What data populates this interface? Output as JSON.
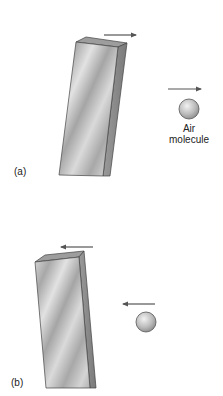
{
  "figure": {
    "panels": [
      {
        "id": "a",
        "label": "(a)",
        "slab_motion": "right",
        "molecule_motion": "right",
        "molecule_label_line1": "Air",
        "molecule_label_line2": "molecule"
      },
      {
        "id": "b",
        "label": "(b)",
        "slab_motion": "left",
        "molecule_motion": "left"
      }
    ]
  },
  "colors": {
    "slab_front": "#c8c8c8",
    "slab_side": "#8a8a8a",
    "slab_top": "#9a9a9a",
    "arrow": "#555555",
    "sphere": "#bdbdbd",
    "outline": "#444444"
  }
}
